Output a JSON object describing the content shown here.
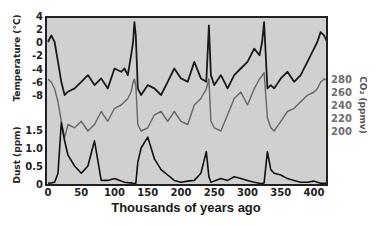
{
  "chart_data": {
    "type": "line",
    "title": "",
    "xlabel": "Thousands of years ago",
    "xlim": [
      0,
      420
    ],
    "x_ticks": [
      0,
      50,
      100,
      150,
      200,
      250,
      300,
      350,
      400
    ],
    "grid": false,
    "legend": null,
    "panels": [
      {
        "name": "temperature",
        "ylabel": "Temperature (°C)",
        "axis_side": "left",
        "ylim": [
          -9,
          4
        ],
        "y_ticks": [
          4,
          2,
          0,
          -2,
          -4,
          -6,
          -8
        ],
        "color": "#1a1a1a"
      },
      {
        "name": "co2",
        "ylabel": "CO2 (ppmv)",
        "axis_side": "right",
        "ylim": [
          180,
          290
        ],
        "y_ticks": [
          280,
          260,
          240,
          220,
          200
        ],
        "color": "#666666"
      },
      {
        "name": "dust",
        "ylabel": "Dust (ppm)",
        "axis_side": "left",
        "ylim": [
          0,
          1.9
        ],
        "y_ticks": [
          1.5,
          1.0,
          0.5,
          0
        ],
        "color": "#111111"
      }
    ],
    "x": [
      0,
      5,
      10,
      15,
      20,
      25,
      30,
      40,
      50,
      60,
      70,
      80,
      90,
      100,
      110,
      115,
      120,
      125,
      128,
      130,
      132,
      135,
      140,
      150,
      160,
      170,
      180,
      190,
      200,
      210,
      220,
      230,
      238,
      242,
      245,
      250,
      260,
      270,
      280,
      290,
      300,
      310,
      318,
      322,
      325,
      330,
      335,
      340,
      350,
      360,
      370,
      380,
      390,
      400,
      405,
      410,
      415,
      420
    ],
    "series": [
      {
        "name": "Temperature (°C)",
        "values": [
          0,
          1,
          0,
          -3,
          -6,
          -8,
          -7.5,
          -7,
          -6,
          -5,
          -6.5,
          -5.5,
          -7,
          -4,
          -4.5,
          -4,
          -5,
          -2,
          0,
          3,
          1,
          -7,
          -8,
          -6.5,
          -7,
          -8,
          -6,
          -4,
          -5.5,
          -6,
          -3,
          -5.5,
          -6,
          2.5,
          -5,
          -6.5,
          -5,
          -7,
          -5,
          -4,
          -3,
          -1,
          -2,
          0,
          3,
          -7,
          -6.5,
          -7,
          -5.5,
          -4.5,
          -6,
          -5,
          -3,
          -1,
          0,
          1.5,
          1,
          0
        ]
      },
      {
        "name": "CO2 (ppmv)",
        "values": [
          280,
          275,
          265,
          245,
          215,
          190,
          210,
          205,
          215,
          200,
          210,
          230,
          215,
          235,
          240,
          245,
          250,
          260,
          275,
          280,
          270,
          210,
          200,
          205,
          225,
          230,
          215,
          230,
          215,
          210,
          240,
          250,
          265,
          280,
          215,
          205,
          200,
          225,
          250,
          260,
          240,
          265,
          280,
          285,
          290,
          220,
          205,
          200,
          215,
          230,
          235,
          245,
          255,
          260,
          265,
          275,
          280,
          278
        ]
      },
      {
        "name": "Dust (ppm)",
        "values": [
          0.02,
          0.03,
          0.05,
          0.3,
          1.7,
          1.2,
          0.8,
          0.5,
          0.3,
          0.5,
          1.2,
          0.1,
          0.1,
          0.15,
          0.08,
          0.05,
          0.04,
          0.03,
          0.02,
          0.01,
          0.02,
          0.6,
          1.0,
          1.3,
          0.7,
          0.4,
          0.25,
          0.1,
          0.05,
          0.08,
          0.1,
          0.3,
          0.9,
          0.2,
          0.05,
          0.08,
          0.15,
          0.1,
          0.2,
          0.15,
          0.1,
          0.05,
          0.02,
          0.01,
          0.03,
          0.9,
          0.4,
          0.3,
          0.25,
          0.15,
          0.1,
          0.05,
          0.05,
          0.08,
          0.05,
          0.02,
          0.02,
          0.02
        ]
      }
    ],
    "annotations": []
  },
  "labels": {
    "temp_axis": "Temperature (°C)",
    "co2_axis": "CO₂ (ppmv)",
    "dust_axis": "Dust (ppm)",
    "x_axis": "Thousands of years ago"
  },
  "style": {
    "plot_bg": "#d0d0d0",
    "frame": "#222222",
    "temp_color": "#1a1a1a",
    "co2_color": "#666666",
    "dust_color": "#111111"
  }
}
